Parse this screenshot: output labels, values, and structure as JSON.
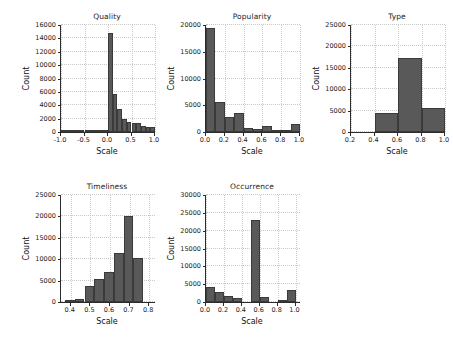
{
  "figure": {
    "background_color": "#ffffff",
    "bar_color": "#595959",
    "bar_edge_color": "#3a3a3a",
    "axis_color": "#2b2b2b",
    "grid_color": "#c8c8c8",
    "grid": true,
    "shared_xlabel": "Scale",
    "shared_ylabel": "Count"
  },
  "chart_data": [
    {
      "id": "quality",
      "type": "bar",
      "title": "Quality",
      "xlabel": "Scale",
      "ylabel": "Count",
      "xlim": [
        -1.0,
        1.0
      ],
      "ylim": [
        0,
        16000
      ],
      "xticks": [
        -1.0,
        -0.5,
        0.0,
        0.5,
        1.0
      ],
      "xtick_labels": [
        "-1.0",
        "-0.5",
        "0.0",
        "0.5",
        "1.0"
      ],
      "yticks": [
        0,
        2000,
        4000,
        6000,
        8000,
        10000,
        12000,
        14000,
        16000
      ],
      "ytick_labels": [
        "0",
        "2000",
        "4000",
        "6000",
        "8000",
        "10000",
        "12000",
        "14000",
        "16000"
      ],
      "grid": true,
      "bin_width": 0.1,
      "bin_edges": [
        -1.0,
        -0.9,
        -0.8,
        -0.7,
        -0.6,
        -0.5,
        -0.4,
        -0.3,
        -0.2,
        -0.1,
        0.0,
        0.1,
        0.2,
        0.3,
        0.4,
        0.5,
        0.6,
        0.7,
        0.8,
        0.9,
        1.0
      ],
      "values": [
        60,
        20,
        20,
        30,
        30,
        60,
        100,
        120,
        130,
        150,
        14850,
        5700,
        3400,
        2000,
        1500,
        1350,
        1300,
        900,
        700,
        750
      ]
    },
    {
      "id": "popularity",
      "type": "bar",
      "title": "Popularity",
      "xlabel": "Scale",
      "ylabel": "Count",
      "xlim": [
        0.0,
        1.0
      ],
      "ylim": [
        0,
        20000
      ],
      "xticks": [
        0.0,
        0.2,
        0.4,
        0.6,
        0.8,
        1.0
      ],
      "xtick_labels": [
        "0.0",
        "0.2",
        "0.4",
        "0.6",
        "0.8",
        "1.0"
      ],
      "yticks": [
        0,
        5000,
        10000,
        15000,
        20000
      ],
      "ytick_labels": [
        "0",
        "5000",
        "10000",
        "15000",
        "20000"
      ],
      "grid": true,
      "bin_width": 0.1,
      "bin_edges": [
        0.0,
        0.1,
        0.2,
        0.3,
        0.4,
        0.5,
        0.6,
        0.7,
        0.8,
        0.9,
        1.0
      ],
      "values": [
        19400,
        5700,
        2900,
        3600,
        800,
        600,
        1100,
        350,
        300,
        1450
      ]
    },
    {
      "id": "type",
      "type": "bar",
      "title": "Type",
      "xlabel": "Scale",
      "ylabel": "Count",
      "xlim": [
        0.2,
        1.0
      ],
      "ylim": [
        0,
        25000
      ],
      "xticks": [
        0.2,
        0.4,
        0.6,
        0.8,
        1.0
      ],
      "xtick_labels": [
        "0.2",
        "0.4",
        "0.6",
        "0.8",
        "1.0"
      ],
      "yticks": [
        0,
        5000,
        10000,
        15000,
        20000,
        25000
      ],
      "ytick_labels": [
        "0",
        "5000",
        "10000",
        "15000",
        "20000",
        "25000"
      ],
      "grid": true,
      "bin_width": 0.2,
      "bin_edges": [
        0.4,
        0.6,
        0.8,
        1.0
      ],
      "values": [
        4500,
        17300,
        5600
      ]
    },
    {
      "id": "timeliness",
      "type": "bar",
      "title": "Timeliness",
      "xlabel": "Scale",
      "ylabel": "Count",
      "xlim": [
        0.35,
        0.83
      ],
      "ylim": [
        0,
        25000
      ],
      "xticks": [
        0.4,
        0.5,
        0.6,
        0.7,
        0.8
      ],
      "xtick_labels": [
        "0.4",
        "0.5",
        "0.6",
        "0.7",
        "0.8"
      ],
      "yticks": [
        0,
        5000,
        10000,
        15000,
        20000,
        25000
      ],
      "ytick_labels": [
        "0",
        "5000",
        "10000",
        "15000",
        "20000",
        "25000"
      ],
      "grid": true,
      "bin_width": 0.05,
      "bin_edges": [
        0.37,
        0.42,
        0.47,
        0.52,
        0.57,
        0.62,
        0.67,
        0.72,
        0.77
      ],
      "values": [
        400,
        700,
        3700,
        5400,
        7100,
        11400,
        20200,
        10400
      ]
    },
    {
      "id": "occurrence",
      "type": "bar",
      "title": "Occurrence",
      "xlabel": "Scale",
      "ylabel": "Count",
      "xlim": [
        0.0,
        1.05
      ],
      "ylim": [
        0,
        30000
      ],
      "xticks": [
        0.0,
        0.2,
        0.4,
        0.6,
        0.8,
        1.0
      ],
      "xtick_labels": [
        "0.0",
        "0.2",
        "0.4",
        "0.6",
        "0.8",
        "1.0"
      ],
      "yticks": [
        0,
        5000,
        10000,
        15000,
        20000,
        25000,
        30000
      ],
      "ytick_labels": [
        "0",
        "5000",
        "10000",
        "15000",
        "20000",
        "25000",
        "30000"
      ],
      "grid": true,
      "bin_width": 0.1,
      "bin_edges": [
        0.0,
        0.1,
        0.2,
        0.3,
        0.4,
        0.5,
        0.6,
        0.7,
        0.8,
        0.9,
        1.0
      ],
      "values": [
        4300,
        2800,
        1700,
        1200,
        0,
        23000,
        1400,
        0,
        200,
        3500
      ]
    }
  ],
  "panels": [
    {
      "id": "quality",
      "left": 18,
      "top": 12,
      "width": 140,
      "height": 150
    },
    {
      "id": "popularity",
      "left": 163,
      "top": 12,
      "width": 140,
      "height": 150
    },
    {
      "id": "type",
      "left": 308,
      "top": 12,
      "width": 140,
      "height": 150
    },
    {
      "id": "timeliness",
      "left": 18,
      "top": 182,
      "width": 140,
      "height": 150
    },
    {
      "id": "occurrence",
      "left": 163,
      "top": 182,
      "width": 140,
      "height": 150
    }
  ]
}
